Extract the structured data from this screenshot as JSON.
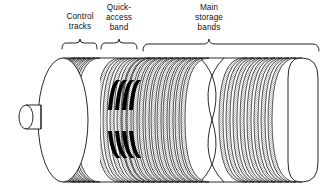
{
  "figure": {
    "labels": [
      {
        "id": "control-tracks",
        "lines": [
          "Control",
          "tracks"
        ],
        "x": 80,
        "y": 19
      },
      {
        "id": "quick-access-band",
        "lines": [
          "Quick-",
          "access",
          "band"
        ],
        "x": 119,
        "y": 10
      },
      {
        "id": "main-storage-bands",
        "lines": [
          "Main",
          "storage",
          "bands"
        ],
        "x": 209,
        "y": 10
      }
    ],
    "braces": [
      {
        "id": "brace-control-tracks",
        "x1": 62,
        "x2": 97,
        "y": 48,
        "tip_y": 41
      },
      {
        "id": "brace-quick-access",
        "x1": 101,
        "x2": 140,
        "y": 48,
        "tip_y": 41
      },
      {
        "id": "brace-main-storage",
        "x1": 144,
        "x2": 319,
        "y": 49,
        "tip_y": 41
      }
    ],
    "drum": {
      "left_cap_cx": 63,
      "left_cap_cy": 120,
      "left_cap_rx": 25,
      "left_cap_ry": 62,
      "axle": {
        "x": 14,
        "y": 105,
        "w": 27,
        "h": 24
      },
      "body_top": 58,
      "body_bottom": 182,
      "right_cap_x": 300,
      "break_x": 214
    },
    "band_groups": [
      {
        "id": "control-tracks-bands",
        "count": 7,
        "x_start": 62,
        "x_end": 97,
        "shaded": true
      },
      {
        "id": "quick-access-bands",
        "count": 4,
        "x_start": 106,
        "x_end": 140,
        "shaded": true,
        "has_black_marks": true
      },
      {
        "id": "main-storage-bands-left",
        "count": 11,
        "x_start": 146,
        "x_end": 205,
        "shaded": true
      },
      {
        "id": "main-storage-bands-right",
        "count": 9,
        "x_start": 232,
        "x_end": 300,
        "shaded": true
      }
    ],
    "black_mark_rows": [
      {
        "id": "upper-marks",
        "y": 81,
        "h": 30
      },
      {
        "id": "lower-marks",
        "y": 131,
        "h": 26
      }
    ],
    "colors": {
      "stroke": "#111111",
      "band_shade": "#c9c9c9",
      "mark": "#000000",
      "background": "#ffffff"
    }
  }
}
